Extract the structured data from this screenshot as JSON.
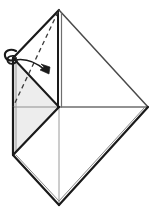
{
  "figure": {
    "type": "origami-diagram",
    "canvas": {
      "width": 159,
      "height": 210,
      "background": "#ffffff"
    },
    "colors": {
      "outline": "#1a1a1a",
      "inner_line": "#6e6e6e",
      "crease_dashed": "#3a3a3a",
      "shaded_fill": "#ededed",
      "white_fill": "#ffffff",
      "arrow": "#1a1a1a",
      "background": "#ffffff"
    },
    "points": {
      "apex_top": {
        "x": 59,
        "y": 10,
        "label": "top apex"
      },
      "left_upper": {
        "x": 13,
        "y": 58,
        "label": "upper left corner"
      },
      "center": {
        "x": 59,
        "y": 107,
        "label": "center point"
      },
      "left_lower": {
        "x": 13,
        "y": 155,
        "label": "lower left corner"
      },
      "right": {
        "x": 148,
        "y": 107,
        "label": "right corner"
      },
      "bottom": {
        "x": 59,
        "y": 205,
        "label": "bottom point"
      }
    },
    "panels": [
      {
        "name": "left-upper-flap",
        "fill": "#ededed",
        "note": "shaded upper-left triangle"
      },
      {
        "name": "left-lower-flap",
        "fill": "#ededed",
        "note": "shaded lower-left triangle"
      },
      {
        "name": "right-upper-panel",
        "fill": "#ffffff",
        "note": "white upper-right triangle"
      },
      {
        "name": "right-lower-panel",
        "fill": "#ffffff",
        "note": "white lower-right triangle"
      },
      {
        "name": "bottom-panel",
        "fill": "#ffffff",
        "note": "white bottom diamond half"
      }
    ],
    "creases": [
      {
        "name": "valley-crease-dashed",
        "style": "dashed",
        "from": "apex_top",
        "to": "center",
        "note": "dashed diagonal fold line from top apex down to center-left"
      },
      {
        "name": "center-vertical-line",
        "style": "solid-double",
        "from": "apex_top",
        "to": "bottom"
      },
      {
        "name": "center-horizontal-line",
        "style": "solid",
        "from": "center",
        "to": "right"
      }
    ],
    "arrows": [
      {
        "name": "fold-arrow",
        "direction": "down-right",
        "style": "curved-with-loop-tail",
        "tail_loop": true,
        "from": {
          "x": 14,
          "y": 60
        },
        "to": {
          "x": 48,
          "y": 73
        },
        "note": "indicates folding the upper-left flap over to the right"
      }
    ],
    "labels": []
  }
}
